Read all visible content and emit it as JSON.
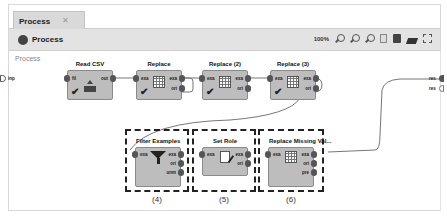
{
  "tabs": [
    {
      "label": "Process",
      "close": "✕"
    }
  ],
  "toolbar": {
    "title": "Process",
    "zoom_level": "100%",
    "icons": [
      "zoom-in-icon",
      "zoom-out-icon",
      "zoom-reset-icon",
      "notes-icon",
      "auto-wire-icon",
      "layers-icon",
      "fit-view-icon"
    ]
  },
  "breadcrumb": "Process",
  "process_ports": {
    "left_input": "inp",
    "right_outputs": [
      "res",
      "res"
    ]
  },
  "operators": [
    {
      "id": "read-csv",
      "title": "Read CSV",
      "inputs": [
        "fil"
      ],
      "outputs": [
        "out"
      ],
      "status": "✔"
    },
    {
      "id": "replace",
      "title": "Replace",
      "inputs": [
        "exa"
      ],
      "outputs": [
        "exa",
        "ori"
      ],
      "status": "✔"
    },
    {
      "id": "replace-2",
      "title": "Replace (2)",
      "inputs": [
        "exa"
      ],
      "outputs": [
        "exa",
        "ori"
      ],
      "status": "✔"
    },
    {
      "id": "replace-3",
      "title": "Replace (3)",
      "inputs": [
        "exa"
      ],
      "outputs": [
        "exa",
        "ori"
      ],
      "status": "✔"
    },
    {
      "id": "filter-examples",
      "title": "Filter Examples",
      "inputs": [
        "exa"
      ],
      "outputs": [
        "exa",
        "ori",
        "unm"
      ],
      "status": ""
    },
    {
      "id": "set-role",
      "title": "Set Role",
      "inputs": [
        "exa"
      ],
      "outputs": [
        "exa",
        "ori"
      ],
      "status": ""
    },
    {
      "id": "replace-missing",
      "title": "Replace Missing Val...",
      "inputs": [
        "exa"
      ],
      "outputs": [
        "exa",
        "ori",
        "pre"
      ],
      "status": ""
    }
  ],
  "annotations": [
    "(4)",
    "(5)",
    "(6)"
  ]
}
